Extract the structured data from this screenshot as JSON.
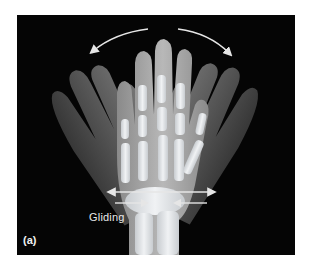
{
  "figure": {
    "panel_label": "(a)",
    "annotation": "Gliding",
    "arrows": {
      "rotation": "curved arrows above fingers indicating side-to-side motion",
      "gliding": "horizontal arrows across carpal bones"
    },
    "colors": {
      "background": "#050505",
      "page": "#ffffff",
      "arrow": "#e6e6e6",
      "bone": "#d9dde0",
      "skin_dark": "#5a5a5a",
      "skin_light": "#9a9a9a"
    }
  }
}
